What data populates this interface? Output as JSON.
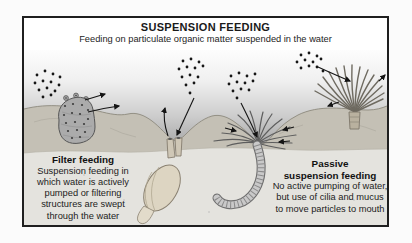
{
  "colors": {
    "frame_border": "#1f1f1f",
    "ink": "#1a1a1a",
    "page_bg": "#fbfbfb",
    "water_top": "#fdfdfd",
    "water_bottom": "#a6a6a6",
    "seabed": "#c4c0b5",
    "seabed_line": "#8d897d",
    "seabed_light": "#e4e3de",
    "shell": "#ddd5c2"
  },
  "figure": {
    "title": "SUSPENSION FEEDING",
    "subtitle": "Feeding on particulate organic matter suspended in the water",
    "left_caption": {
      "heading": "Filter feeding",
      "lines": [
        "Suspension feeding in",
        "which water is actively",
        "pumped or filtering",
        "structures are swept",
        "through the water"
      ]
    },
    "right_caption": {
      "heading_lines": [
        "Passive",
        "suspension feeding"
      ],
      "lines": [
        "No active pumping of water,",
        "but use of cilia and mucus",
        "to move particles to mouth"
      ]
    },
    "organisms": [
      "sponge",
      "buried clam with siphons",
      "tube-dwelling worm with tentacle crown",
      "fan worm"
    ]
  }
}
